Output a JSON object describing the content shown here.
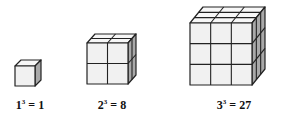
{
  "diagram": {
    "colors": {
      "front": "#f1f1f1",
      "top": "#f7f7f7",
      "side": "#a9a9a9",
      "edge": "#222222"
    },
    "cubes": [
      {
        "n": 1,
        "base": "1",
        "exp": "3",
        "result": "1"
      },
      {
        "n": 2,
        "base": "2",
        "exp": "3",
        "result": "8"
      },
      {
        "n": 3,
        "base": "3",
        "exp": "3",
        "result": "27"
      }
    ]
  }
}
